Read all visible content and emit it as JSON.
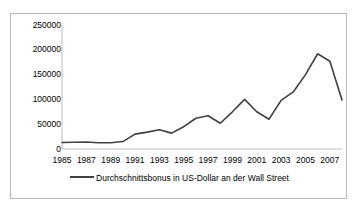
{
  "chart_data": {
    "type": "line",
    "title": "",
    "xlabel": "",
    "ylabel": "",
    "ylim": [
      0,
      250000
    ],
    "xlim": [
      1985,
      2008
    ],
    "grid": false,
    "legend_position": "bottom",
    "line_color": "#404040",
    "axis_color": "#bfbfbf",
    "series": [
      {
        "name": "Durchschnittsbonus in US-Dollar an der Wall Street",
        "x": [
          1985,
          1986,
          1987,
          1988,
          1989,
          1990,
          1991,
          1992,
          1993,
          1994,
          1995,
          1996,
          1997,
          1998,
          1999,
          2000,
          2001,
          2002,
          2003,
          2004,
          2005,
          2006,
          2007,
          2008
        ],
        "values": [
          13000,
          13500,
          14000,
          12500,
          12500,
          15000,
          30000,
          34000,
          39000,
          32000,
          45000,
          62000,
          67000,
          52000,
          75000,
          100000,
          75000,
          60000,
          98000,
          115000,
          150000,
          192000,
          177000,
          99000
        ]
      }
    ],
    "y_ticks": [
      {
        "value": 250000,
        "label": "250000"
      },
      {
        "value": 200000,
        "label": "200000"
      },
      {
        "value": 150000,
        "label": "150000"
      },
      {
        "value": 100000,
        "label": "100000"
      },
      {
        "value": 50000,
        "label": "50000"
      },
      {
        "value": 0,
        "label": "0"
      }
    ],
    "x_ticks": [
      {
        "value": 1985,
        "label": "1985"
      },
      {
        "value": 1987,
        "label": "1987"
      },
      {
        "value": 1989,
        "label": "1989"
      },
      {
        "value": 1991,
        "label": "1991"
      },
      {
        "value": 1993,
        "label": "1993"
      },
      {
        "value": 1995,
        "label": "1995"
      },
      {
        "value": 1997,
        "label": "1997"
      },
      {
        "value": 1999,
        "label": "1999"
      },
      {
        "value": 2001,
        "label": "2001"
      },
      {
        "value": 2003,
        "label": "2003"
      },
      {
        "value": 2005,
        "label": "2005"
      },
      {
        "value": 2007,
        "label": "2007"
      }
    ]
  },
  "legend": {
    "entry_label": "Durchschnittsbonus in US-Dollar an der Wall Street"
  }
}
